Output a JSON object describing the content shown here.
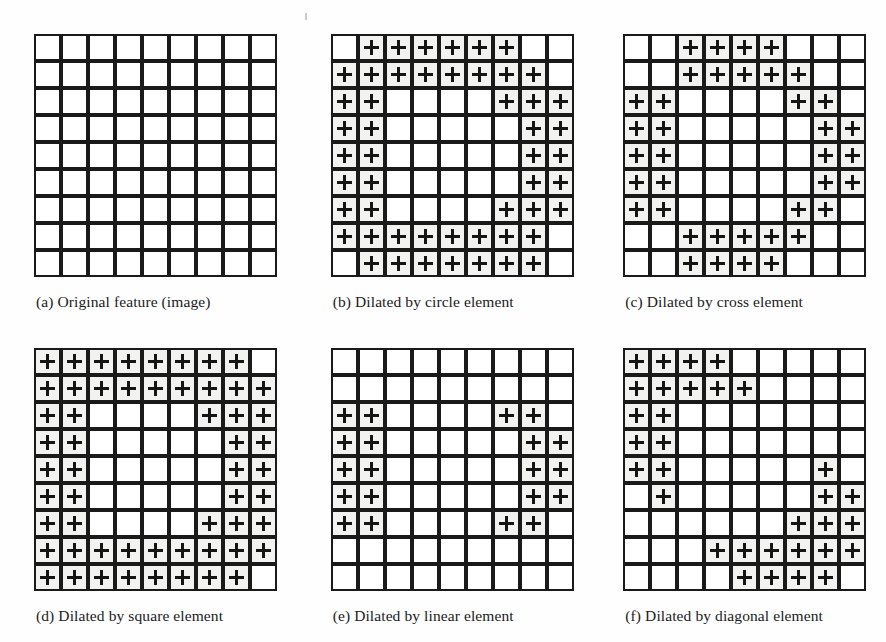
{
  "figure": {
    "grid_size": 9,
    "marker_glyph": "+",
    "colors": {
      "cell_border": "#1a1a1a",
      "cell_background": "#ffffff",
      "filled_background": "#f2f2f0",
      "marker": "#151515",
      "page_background": "#fefefe",
      "caption_text": "#1b1b1b"
    }
  },
  "panels": [
    {
      "id": "a",
      "caption": "(a) Original feature (image)",
      "structuring_element": "none",
      "filled": [
        [],
        [],
        [],
        [],
        [],
        [],
        [],
        [],
        []
      ]
    },
    {
      "id": "b",
      "caption": "(b) Dilated by circle element",
      "structuring_element": "circle",
      "filled": [
        [
          1,
          2,
          3,
          4,
          5,
          6
        ],
        [
          0,
          1,
          2,
          3,
          4,
          5,
          6,
          7
        ],
        [
          0,
          1,
          6,
          7,
          8
        ],
        [
          0,
          1,
          7,
          8
        ],
        [
          0,
          1,
          7,
          8
        ],
        [
          0,
          1,
          7,
          8
        ],
        [
          0,
          1,
          6,
          7,
          8
        ],
        [
          0,
          1,
          2,
          3,
          4,
          5,
          6,
          7
        ],
        [
          1,
          2,
          3,
          4,
          5,
          6,
          7
        ]
      ]
    },
    {
      "id": "c",
      "caption": "(c) Dilated by cross element",
      "structuring_element": "cross",
      "filled": [
        [
          2,
          3,
          4,
          5
        ],
        [
          2,
          3,
          4,
          5,
          6
        ],
        [
          0,
          1,
          6,
          7
        ],
        [
          0,
          1,
          7,
          8
        ],
        [
          0,
          1,
          7,
          8
        ],
        [
          0,
          1,
          7,
          8
        ],
        [
          0,
          1,
          6,
          7
        ],
        [
          2,
          3,
          4,
          5,
          6
        ],
        [
          2,
          3,
          4,
          5
        ]
      ]
    },
    {
      "id": "d",
      "caption": "(d) Dilated by square element",
      "structuring_element": "square",
      "filled": [
        [
          0,
          1,
          2,
          3,
          4,
          5,
          6,
          7
        ],
        [
          0,
          1,
          2,
          3,
          4,
          5,
          6,
          7,
          8
        ],
        [
          0,
          1,
          6,
          7,
          8
        ],
        [
          0,
          1,
          7,
          8
        ],
        [
          0,
          1,
          7,
          8
        ],
        [
          0,
          1,
          7,
          8
        ],
        [
          0,
          1,
          6,
          7,
          8
        ],
        [
          0,
          1,
          2,
          3,
          4,
          5,
          6,
          7,
          8
        ],
        [
          0,
          1,
          2,
          3,
          4,
          5,
          6,
          7
        ]
      ]
    },
    {
      "id": "e",
      "caption": "(e) Dilated by linear element",
      "structuring_element": "linear",
      "filled": [
        [],
        [],
        [
          0,
          1,
          6,
          7
        ],
        [
          0,
          1,
          7,
          8
        ],
        [
          0,
          1,
          7,
          8
        ],
        [
          0,
          1,
          7,
          8
        ],
        [
          0,
          1,
          6,
          7
        ],
        [],
        []
      ]
    },
    {
      "id": "f",
      "caption": "(f) Dilated by diagonal element",
      "structuring_element": "diagonal",
      "filled": [
        [
          0,
          1,
          2,
          3
        ],
        [
          0,
          1,
          2,
          3,
          4
        ],
        [
          0,
          1
        ],
        [
          0,
          1
        ],
        [
          0,
          1,
          7
        ],
        [
          1,
          7,
          8
        ],
        [
          6,
          7,
          8
        ],
        [
          3,
          4,
          5,
          6,
          7,
          8
        ],
        [
          4,
          5,
          6,
          7
        ]
      ]
    }
  ]
}
